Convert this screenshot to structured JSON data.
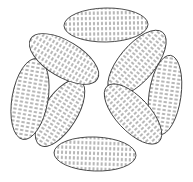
{
  "figure": {
    "caption": "",
    "width": 193,
    "height": 182,
    "background_color": "#ffffff",
    "stroke_color": "#3c3c3c",
    "hatch_color": "#6e6e6e",
    "stroke_width": 0.9,
    "center": {
      "x": 96,
      "y": 90
    },
    "void_description": "white four-lobed void at the center of the rosette"
  },
  "hatch_pattern": {
    "name": "vertical-dash-hatch",
    "orientation": "vertical",
    "dash_width": 1,
    "dash_length": 3.2,
    "gap_length": 2.0,
    "column_spacing": 4.0,
    "row_offset": 2.6,
    "color": "#6e6e6e"
  },
  "ellipses": [
    {
      "id": "ellipse-top",
      "label": "top",
      "position": "top",
      "cx": 106,
      "cy": 25,
      "rx": 42,
      "ry": 17,
      "rotation": -1,
      "fill": "vertical-dash-hatch"
    },
    {
      "id": "ellipse-upper-right",
      "label": "upper-right",
      "position": "upper-right",
      "cx": 137,
      "cy": 63,
      "rx": 40,
      "ry": 18,
      "rotation": -50,
      "fill": "vertical-dash-hatch"
    },
    {
      "id": "ellipse-right",
      "label": "right",
      "position": "right",
      "cx": 165,
      "cy": 95,
      "rx": 40,
      "ry": 16,
      "rotation": -82,
      "fill": "vertical-dash-hatch"
    },
    {
      "id": "ellipse-lower-right",
      "label": "lower-right",
      "position": "lower-right",
      "cx": 133,
      "cy": 114,
      "rx": 38,
      "ry": 17,
      "rotation": 47,
      "fill": "vertical-dash-hatch"
    },
    {
      "id": "ellipse-bottom",
      "label": "bottom",
      "position": "bottom",
      "cx": 95,
      "cy": 154,
      "rx": 41,
      "ry": 17,
      "rotation": 2,
      "fill": "vertical-dash-hatch"
    },
    {
      "id": "ellipse-lower-left",
      "label": "lower-left",
      "position": "lower-left",
      "cx": 60,
      "cy": 113,
      "rx": 38,
      "ry": 17,
      "rotation": -58,
      "fill": "vertical-dash-hatch"
    },
    {
      "id": "ellipse-left",
      "label": "left",
      "position": "left",
      "cx": 30,
      "cy": 99,
      "rx": 41,
      "ry": 18,
      "rotation": -80,
      "fill": "vertical-dash-hatch"
    },
    {
      "id": "ellipse-upper-left",
      "label": "upper-left",
      "position": "upper-left",
      "cx": 64,
      "cy": 59,
      "rx": 39,
      "ry": 18,
      "rotation": 31,
      "fill": "vertical-dash-hatch"
    }
  ]
}
